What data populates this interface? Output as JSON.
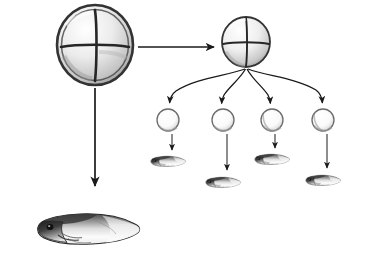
{
  "figure": {
    "background_color": "#ffffff",
    "ink_color": "#1a1a1a",
    "width": 367,
    "height": 265,
    "labels": [],
    "caption": ""
  },
  "elements": {
    "intact_embryo": {
      "name": "four-cell-stage embryo",
      "stage": "4-cell",
      "cell_count": 4,
      "cx": 95,
      "cy": 45,
      "rx": 38,
      "ry": 40,
      "membrane_color": "#3a3a3a",
      "cytoplasm_color": "#e9e9e9",
      "furrow_color": "#2b2b2b"
    },
    "copy_embryo": {
      "name": "four-cell-stage embryo copy",
      "stage": "4-cell",
      "cell_count": 4,
      "cx": 246,
      "cy": 42,
      "rx": 24,
      "ry": 25,
      "membrane_color": "#3a3a3a",
      "cytoplasm_color": "#ececec",
      "furrow_color": "#2b2b2b"
    },
    "separated_cells": {
      "name": "separated blastomeres",
      "count": 4,
      "radius": 11,
      "cy": 120,
      "cx_list": [
        168,
        223,
        272,
        323
      ],
      "outline_color": "#6b6b6b",
      "fill_color": "#fbfbfb"
    },
    "small_tadpoles": {
      "name": "small tadpoles",
      "count": 4,
      "positions": [
        {
          "x": 168,
          "y": 161,
          "scale": 0.34
        },
        {
          "x": 223,
          "y": 182,
          "scale": 0.34
        },
        {
          "x": 272,
          "y": 159,
          "scale": 0.34
        },
        {
          "x": 323,
          "y": 180,
          "scale": 0.34
        }
      ]
    },
    "large_tadpole": {
      "name": "normal tadpole",
      "x": 88,
      "y": 228,
      "scale": 1.0
    }
  },
  "arrows": {
    "to_copy": {
      "name": "straight arrow to second embryo",
      "kind": "straight",
      "x1": 138,
      "y1": 47,
      "x2": 218,
      "y2": 47
    },
    "to_large_tadpole": {
      "name": "straight arrow down to normal tadpole",
      "kind": "straight",
      "x1": 95,
      "y1": 88,
      "x2": 95,
      "y2": 190
    },
    "fan": {
      "name": "curved arrows to separated blastomeres",
      "kind": "curved",
      "origin_x": 246,
      "origin_y": 70,
      "targets": [
        {
          "x": 170,
          "y": 104
        },
        {
          "x": 222,
          "y": 104
        },
        {
          "x": 270,
          "y": 104
        },
        {
          "x": 322,
          "y": 104
        }
      ]
    },
    "cell_to_tadpole": {
      "name": "straight arrows from blastomeres to tadpoles",
      "kind": "straight",
      "pairs": [
        {
          "x1": 172,
          "y1": 134,
          "x2": 172,
          "y2": 152
        },
        {
          "x1": 227,
          "y1": 134,
          "x2": 227,
          "y2": 172
        },
        {
          "x1": 275,
          "y1": 134,
          "x2": 275,
          "y2": 150
        },
        {
          "x1": 327,
          "y1": 134,
          "x2": 327,
          "y2": 170
        }
      ]
    }
  }
}
